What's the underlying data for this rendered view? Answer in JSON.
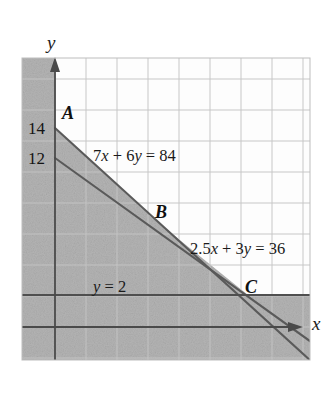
{
  "figure": {
    "title": "",
    "type": "linear-programming-feasible-region-graph",
    "axes": {
      "x_axis_label": "x",
      "y_axis_label": "y",
      "y_tick_labels": [
        "14",
        "12"
      ],
      "x_tick_labels": []
    },
    "lines": [
      {
        "id": "line-1",
        "label": "7x + 6y = 84",
        "label_parts": {
          "a": "7",
          "xvar": "x",
          "plus": " + ",
          "b": "6",
          "yvar": "y",
          "eq": " = ",
          "rhs": "84"
        }
      },
      {
        "id": "line-2",
        "label": "2.5x + 3y = 36",
        "label_parts": {
          "a": "2.5",
          "xvar": "x",
          "plus": " + ",
          "b": "3",
          "yvar": "y",
          "eq": " = ",
          "rhs": "36"
        }
      },
      {
        "id": "line-3",
        "label": "y = 2",
        "label_parts": {
          "yvar": "y",
          "eq": " = ",
          "rhs": "2"
        }
      }
    ],
    "points": [
      {
        "id": "point-a",
        "label": "A"
      },
      {
        "id": "point-b",
        "label": "B"
      },
      {
        "id": "point-c",
        "label": "C"
      }
    ],
    "colors": {
      "shading": "#b3b3b3",
      "line": "#4a4a4a",
      "grid": "#c9c9c9",
      "axis": "#555555",
      "text": "#141414",
      "background": "#ffffff"
    }
  },
  "chart_data": {
    "type": "line",
    "title": "",
    "xlabel": "x",
    "ylabel": "y",
    "grid": true,
    "legend": "none",
    "xlim": [
      -2,
      16
    ],
    "ylim": [
      -2,
      18
    ],
    "series": [
      {
        "name": "7x + 6y = 84",
        "equation": "7x + 6y = 84",
        "x": [
          0,
          12
        ],
        "y": [
          14,
          0
        ],
        "intercepts": {
          "y": 14,
          "x": 12
        }
      },
      {
        "name": "2.5x + 3y = 36",
        "equation": "2.5x + 3y = 36",
        "x": [
          0,
          14.4
        ],
        "y": [
          12,
          0
        ],
        "intercepts": {
          "y": 12,
          "x": 14.4
        }
      },
      {
        "name": "y = 2",
        "equation": "y = 2",
        "x": [
          -2,
          16
        ],
        "y": [
          2,
          2
        ],
        "intercepts": {
          "y": 2
        }
      }
    ],
    "annotations": [
      {
        "text": "A",
        "x": 0,
        "y": 14
      },
      {
        "text": "B",
        "x": 6,
        "y": 7
      },
      {
        "text": "C",
        "x": 12,
        "y": 2
      },
      {
        "text": "7x + 6y = 84",
        "x": 2.2,
        "y": 11.4
      },
      {
        "text": "2.5x + 3y = 36",
        "x": 8.7,
        "y": 4.6
      },
      {
        "text": "y = 2",
        "x": 2.6,
        "y": 2.6
      }
    ],
    "shaded_region": {
      "description": "feasible region shaded gray outside the triangle ABC",
      "vertices": [
        [
          0,
          14
        ],
        [
          6,
          7
        ],
        [
          12,
          2
        ]
      ]
    },
    "ytick_values": [
      14,
      12
    ]
  }
}
